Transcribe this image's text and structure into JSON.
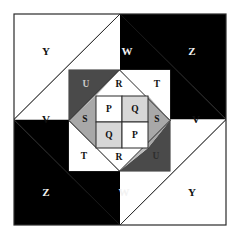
{
  "figure": {
    "canvas": {
      "width": 238,
      "height": 243,
      "background": "#ffffff"
    },
    "colors": {
      "black": "#000000",
      "white": "#ffffff",
      "dark_gray": "#4a4a4a",
      "medium_gray": "#a8a8a8",
      "light_gray": "#d7d7d7",
      "stroke": "#2b2b2b",
      "label_on_dark": "#f2f2f2",
      "label_on_light": "#111111"
    },
    "outer_square": {
      "x1": 14,
      "y1": 14,
      "x2": 226,
      "y2": 225,
      "description": "Outer bounding square with inscribed diamond"
    },
    "outer_labels": [
      {
        "id": "outer-y-tl",
        "text": "Y",
        "x": 46,
        "y": 52,
        "region": "white"
      },
      {
        "id": "outer-w-top",
        "text": "W",
        "x": 127,
        "y": 52,
        "region": "black"
      },
      {
        "id": "outer-z-tr",
        "text": "Z",
        "x": 192,
        "y": 52,
        "region": "black"
      },
      {
        "id": "outer-v-left",
        "text": "V",
        "x": 46,
        "y": 120,
        "region": "white"
      },
      {
        "id": "outer-v-right",
        "text": "V",
        "x": 196,
        "y": 120,
        "region": "white"
      },
      {
        "id": "outer-z-bl",
        "text": "Z",
        "x": 46,
        "y": 193,
        "region": "black"
      },
      {
        "id": "outer-w-bottom",
        "text": "W",
        "x": 124,
        "y": 193,
        "region": "black"
      },
      {
        "id": "outer-y-br",
        "text": "Y",
        "x": 192,
        "y": 193,
        "region": "white"
      }
    ],
    "middle_square": {
      "x1": 69,
      "y1": 70,
      "x2": 170,
      "y2": 171,
      "description": "Middle square containing an inscribed diamond"
    },
    "middle_corner_labels": [
      {
        "id": "mid-u-tl",
        "text": "U",
        "x": 86,
        "y": 85,
        "region": "dark_gray"
      },
      {
        "id": "mid-t-tr",
        "text": "T",
        "x": 157,
        "y": 85,
        "region": "white"
      },
      {
        "id": "mid-t-bl",
        "text": "T",
        "x": 84,
        "y": 157,
        "region": "white"
      },
      {
        "id": "mid-u-br",
        "text": "U",
        "x": 156,
        "y": 157,
        "region": "dark_gray"
      }
    ],
    "middle_edge_labels": [
      {
        "id": "mid-r-top",
        "text": "R",
        "x": 119,
        "y": 85,
        "region": "white"
      },
      {
        "id": "mid-s-left",
        "text": "S",
        "x": 85,
        "y": 120,
        "region": "medium_gray"
      },
      {
        "id": "mid-s-right",
        "text": "S",
        "x": 157,
        "y": 120,
        "region": "medium_gray"
      },
      {
        "id": "mid-r-bottom",
        "text": "R",
        "x": 119,
        "y": 158,
        "region": "white"
      }
    ],
    "inner_grid": {
      "x1": 96,
      "y1": 96,
      "x2": 148,
      "y2": 148,
      "rows": 2,
      "cols": 2,
      "cells": [
        {
          "id": "cell-p-tl",
          "text": "P",
          "x": 109,
          "y": 109,
          "fill": "#ffffff"
        },
        {
          "id": "cell-q-tr",
          "text": "Q",
          "x": 135,
          "y": 109,
          "fill": "#d7d7d7"
        },
        {
          "id": "cell-q-bl",
          "text": "Q",
          "x": 109,
          "y": 135,
          "fill": "#d7d7d7"
        },
        {
          "id": "cell-p-br",
          "text": "P",
          "x": 135,
          "y": 135,
          "fill": "#ffffff"
        }
      ]
    },
    "legend_letters": [
      "P",
      "Q",
      "R",
      "S",
      "T",
      "U",
      "V",
      "W",
      "Y",
      "Z"
    ]
  }
}
